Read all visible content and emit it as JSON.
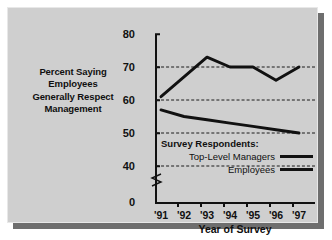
{
  "chart_data": {
    "type": "line",
    "title": "Percent Saying Employees Generally Respect Management",
    "title_lines": [
      "Percent Saying",
      "Employees",
      "Generally Respect",
      "Management"
    ],
    "xlabel": "Year of Survey",
    "ylabel": "",
    "categories": [
      "'91",
      "'92",
      "'93",
      "'94",
      "'95",
      "'96",
      "'97"
    ],
    "series": [
      {
        "name": "Top-Level Managers",
        "values": [
          61,
          67,
          73,
          70,
          70,
          66,
          70
        ]
      },
      {
        "name": "Employees",
        "values": [
          57,
          55,
          54,
          53,
          52,
          51,
          50
        ]
      }
    ],
    "yticks": [
      0,
      40,
      50,
      60,
      70,
      80
    ],
    "ytick_labels": [
      "0",
      "40",
      "50",
      "60",
      "70",
      "80"
    ],
    "gridlines": [
      40,
      50,
      60,
      70
    ],
    "ylim": [
      40,
      80
    ],
    "axis_break": true,
    "grid": true,
    "legend_position": "inside-lower-right",
    "legend_title": "Survey Respondents:",
    "legend_entries": [
      "Top-Level Managers",
      "Employees"
    ]
  },
  "colors": {
    "panel_background": "#cfcfcf",
    "page_background": "#ffffff",
    "shadow": "#6e6e6e",
    "axis": "#111111",
    "series_line": "#111111",
    "text": "#101010"
  }
}
